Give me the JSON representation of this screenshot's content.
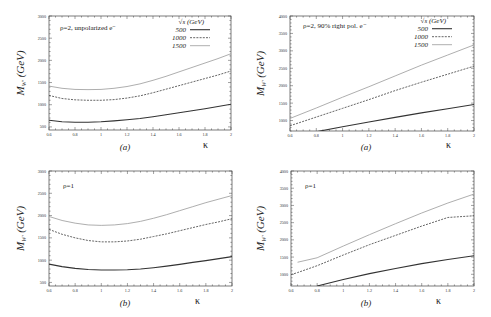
{
  "chart_data": [
    {
      "type": "line",
      "id": "top-left",
      "panel_label": "(a)",
      "annotation": "ρ=2, unpolarized e⁻",
      "xlabel": "κ",
      "ylabel": "M_{W'} (GeV)",
      "xlim": [
        0.6,
        2.0
      ],
      "ylim": [
        430,
        3000
      ],
      "xticks": [
        0.6,
        0.8,
        1,
        1.2,
        1.4,
        1.6,
        1.8,
        2
      ],
      "yticks": [
        500,
        1000,
        1500,
        2000,
        2500,
        3000
      ],
      "legend_title": "√s (GeV)",
      "legend_position": "upper right",
      "x": [
        0.6,
        0.7,
        0.8,
        0.9,
        1.0,
        1.1,
        1.2,
        1.3,
        1.4,
        1.5,
        1.6,
        1.7,
        1.8,
        1.9,
        2.0
      ],
      "series": [
        {
          "name": "500",
          "style": "solid",
          "values": [
            650,
            615,
            605,
            605,
            615,
            635,
            660,
            690,
            730,
            775,
            820,
            865,
            910,
            960,
            1010
          ]
        },
        {
          "name": "1000",
          "style": "dashed",
          "values": [
            1210,
            1140,
            1110,
            1100,
            1100,
            1115,
            1150,
            1200,
            1270,
            1350,
            1430,
            1510,
            1590,
            1670,
            1760
          ]
        },
        {
          "name": "1500",
          "style": "dotted",
          "values": [
            1420,
            1370,
            1345,
            1340,
            1345,
            1370,
            1410,
            1470,
            1550,
            1640,
            1740,
            1840,
            1940,
            2040,
            2150
          ]
        }
      ]
    },
    {
      "type": "line",
      "id": "top-right",
      "panel_label": "(a)",
      "annotation": "ρ=2, 90% right pol. e⁻",
      "xlabel": "κ",
      "ylabel": "M_{W'} (GeV)",
      "xlim": [
        0.6,
        2.0
      ],
      "ylim": [
        700,
        4000
      ],
      "xticks": [
        0.6,
        0.8,
        1,
        1.2,
        1.4,
        1.6,
        1.8,
        2
      ],
      "yticks": [
        1000,
        1500,
        2000,
        2500,
        3000,
        3500,
        4000
      ],
      "legend_title": "√s (GeV)",
      "legend_position": "upper right",
      "x": [
        0.6,
        0.8,
        1.0,
        1.2,
        1.4,
        1.6,
        1.8,
        2.0
      ],
      "series": [
        {
          "name": "500",
          "style": "solid",
          "values": [
            560,
            680,
            820,
            960,
            1090,
            1220,
            1340,
            1460
          ]
        },
        {
          "name": "1000",
          "style": "dashed",
          "values": [
            850,
            1100,
            1350,
            1600,
            1860,
            2100,
            2330,
            2560
          ]
        },
        {
          "name": "1500",
          "style": "dotted",
          "values": [
            1060,
            1360,
            1670,
            1970,
            2280,
            2590,
            2880,
            3170
          ]
        }
      ]
    },
    {
      "type": "line",
      "id": "bottom-left",
      "panel_label": "(b)",
      "annotation": "ρ=1",
      "xlabel": "κ",
      "ylabel": "M_{W'} (GeV)",
      "xlim": [
        0.6,
        2.0
      ],
      "ylim": [
        420,
        3000
      ],
      "xticks": [
        0.6,
        0.8,
        1,
        1.2,
        1.4,
        1.6,
        1.8,
        2
      ],
      "yticks": [
        500,
        1000,
        1500,
        2000,
        2500,
        3000
      ],
      "x": [
        0.6,
        0.7,
        0.8,
        0.9,
        1.0,
        1.1,
        1.2,
        1.3,
        1.4,
        1.5,
        1.6,
        1.7,
        1.8,
        1.9,
        2.0
      ],
      "series": [
        {
          "name": "500",
          "style": "solid",
          "values": [
            910,
            855,
            815,
            790,
            780,
            780,
            785,
            800,
            830,
            865,
            905,
            950,
            990,
            1035,
            1080
          ]
        },
        {
          "name": "1000",
          "style": "dashed",
          "values": [
            1690,
            1580,
            1500,
            1440,
            1410,
            1410,
            1430,
            1470,
            1530,
            1590,
            1660,
            1730,
            1800,
            1860,
            1930
          ]
        },
        {
          "name": "1500",
          "style": "dotted",
          "values": [
            1980,
            1890,
            1830,
            1790,
            1780,
            1790,
            1820,
            1870,
            1940,
            2020,
            2110,
            2200,
            2290,
            2370,
            2450
          ]
        }
      ]
    },
    {
      "type": "line",
      "id": "bottom-right",
      "panel_label": "(b)",
      "annotation": "ρ=1",
      "xlabel": "κ",
      "ylabel": "M_{W'} (GeV)",
      "xlim": [
        0.6,
        2.0
      ],
      "ylim": [
        660,
        4000
      ],
      "xticks": [
        0.6,
        0.8,
        1,
        1.2,
        1.4,
        1.6,
        1.8,
        2
      ],
      "yticks": [
        1000,
        1500,
        2000,
        2500,
        3000,
        3500,
        4000
      ],
      "x": [
        0.6,
        0.65,
        0.8,
        1.0,
        1.2,
        1.4,
        1.6,
        1.8,
        2.0
      ],
      "series": [
        {
          "name": "500",
          "style": "solid",
          "values": [
            null,
            null,
            660,
            850,
            1020,
            1170,
            1310,
            1430,
            1540
          ]
        },
        {
          "name": "1000",
          "style": "dashed",
          "values": [
            990,
            1050,
            1250,
            1560,
            1860,
            2130,
            2400,
            2650,
            2700
          ]
        },
        {
          "name": "1500",
          "style": "dotted",
          "values": [
            null,
            1350,
            1480,
            1820,
            2150,
            2470,
            2780,
            3070,
            3330
          ]
        }
      ]
    }
  ]
}
